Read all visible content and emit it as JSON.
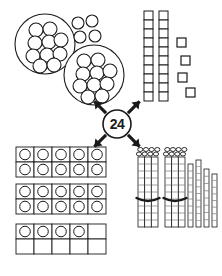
{
  "diagram": {
    "center_value": "24",
    "stroke_color": "#1a1a1a",
    "fill_color": "#ffffff",
    "background": "#ffffff",
    "canvas": {
      "width": 222,
      "height": 276
    }
  },
  "center_node": {
    "label": "24",
    "name": "center-number-24",
    "cx": 117,
    "cy": 124,
    "r": 14,
    "arrow_directions": [
      "up-left",
      "up-right",
      "down-left",
      "down-right"
    ]
  },
  "quadrants": [
    {
      "id": "counters",
      "name": "counters-groups-of-ten",
      "position": "top-left",
      "description": "Two large rings of ten small counters plus four loose counters",
      "groups_of_ten": 2,
      "loose_units": 4,
      "total": 24
    },
    {
      "id": "base-ten-squares",
      "name": "base-ten-square-rods",
      "position": "top-right",
      "description": "Two vertical rods of ten squares plus four loose squares",
      "rods": 2,
      "squares_per_rod": 10,
      "loose_units": 4,
      "total": 24
    },
    {
      "id": "ten-frames",
      "name": "ten-frames",
      "position": "bottom-left",
      "description": "Two full ten-frames plus one ten-frame with four counters",
      "full_frames": 2,
      "partial_frame_count": 4,
      "total": 24
    },
    {
      "id": "bundled-sticks",
      "name": "bundled-sticks",
      "position": "bottom-right",
      "description": "Two bundles of ten sticks plus four loose sticks",
      "bundles": 2,
      "sticks_per_bundle": 10,
      "loose_units": 4,
      "total": 24
    }
  ],
  "counters_quadrant": {
    "ring_a": {
      "cx": 45,
      "cy": 44,
      "r": 30,
      "counter_r": 7,
      "count": 10,
      "counters": [
        [
          36,
          30
        ],
        [
          50,
          29
        ],
        [
          35,
          43
        ],
        [
          49,
          42
        ],
        [
          61,
          40
        ],
        [
          33,
          56
        ],
        [
          47,
          55
        ],
        [
          60,
          54
        ],
        [
          40,
          66
        ],
        [
          54,
          65
        ]
      ]
    },
    "ring_b": {
      "cx": 94,
      "cy": 75,
      "r": 30,
      "counter_r": 7,
      "count": 10,
      "counters": [
        [
          84,
          61
        ],
        [
          98,
          60
        ],
        [
          83,
          74
        ],
        [
          97,
          73
        ],
        [
          110,
          71
        ],
        [
          80,
          86
        ],
        [
          94,
          85
        ],
        [
          107,
          84
        ],
        [
          88,
          97
        ],
        [
          102,
          96
        ]
      ]
    },
    "loose": {
      "counter_r": 6,
      "count": 4,
      "counters": [
        [
          78,
          23
        ],
        [
          92,
          21
        ],
        [
          80,
          37
        ],
        [
          95,
          36
        ]
      ]
    }
  },
  "squares_quadrant": {
    "rod_a": {
      "x": 144,
      "y": 11,
      "cell": 9,
      "count": 10
    },
    "rod_b": {
      "x": 159,
      "y": 11,
      "cell": 9,
      "count": 10
    },
    "loose": {
      "size": 9,
      "count": 4,
      "squares": [
        [
          177,
          38
        ],
        [
          181,
          56
        ],
        [
          178,
          73
        ],
        [
          186,
          88
        ]
      ]
    }
  },
  "tenframe_quadrant": {
    "cell_w": 18,
    "cell_h": 15,
    "frames": [
      {
        "x": 16,
        "y": 147,
        "cols": 5,
        "rows": 2,
        "filled": 10,
        "name": "ten-frame-full-1"
      },
      {
        "x": 16,
        "y": 184,
        "cols": 5,
        "rows": 2,
        "filled": 10,
        "name": "ten-frame-full-2"
      },
      {
        "x": 16,
        "y": 224,
        "cols": 5,
        "rows": 2,
        "filled": 4,
        "name": "ten-frame-partial"
      }
    ]
  },
  "sticks_quadrant": {
    "bundles": [
      {
        "x": 138,
        "y": 157,
        "w": 20,
        "h": 70,
        "band_y": 200,
        "sticks": 10,
        "name": "stick-bundle-1"
      },
      {
        "x": 165,
        "y": 157,
        "w": 20,
        "h": 70,
        "band_y": 200,
        "sticks": 10,
        "name": "stick-bundle-2"
      }
    ],
    "loose_sticks": [
      {
        "x": 188,
        "y": 164,
        "w": 5,
        "h": 63
      },
      {
        "x": 196,
        "y": 160,
        "w": 5,
        "h": 67
      },
      {
        "x": 204,
        "y": 169,
        "w": 5,
        "h": 58
      },
      {
        "x": 212,
        "y": 174,
        "w": 5,
        "h": 53
      }
    ]
  }
}
